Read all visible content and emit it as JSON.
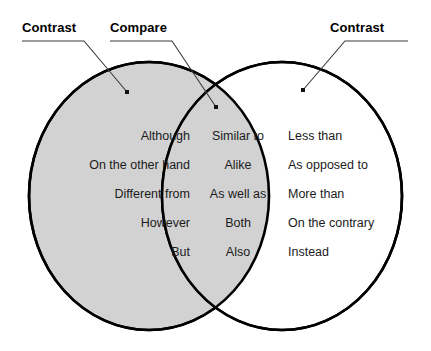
{
  "diagram": {
    "type": "venn-two-circle",
    "colors": {
      "left_circle_fill": "#d2d2d2",
      "right_circle_fill": "#ffffff",
      "overlap_fill": "#d2d2d2",
      "stroke": "#000000",
      "text": "#1b1b1b",
      "label_text": "#000000",
      "leader_line": "#3a3a3a",
      "background": "#ffffff"
    }
  },
  "callouts": {
    "contrast_left": "Contrast",
    "compare": "Compare",
    "contrast_right": "Contrast"
  },
  "regions": {
    "left": {
      "name": "Contrast",
      "words": [
        "Although",
        "On the other hand",
        "Different from",
        "However",
        "But"
      ]
    },
    "center": {
      "name": "Compare",
      "words": [
        "Similar to",
        "Alike",
        "As well as",
        "Both",
        "Also"
      ]
    },
    "right": {
      "name": "Contrast",
      "words": [
        "Less than",
        "As opposed to",
        "More than",
        "On the contrary",
        "Instead"
      ]
    }
  }
}
